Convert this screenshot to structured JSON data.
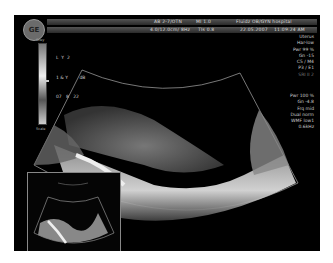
{
  "header": {
    "logo": "GE",
    "row1": [
      "AB 2-7/OTN",
      "MI 1.0",
      "TIs 0.0",
      "Fluidz OB/GYN hospital"
    ],
    "row2": [
      "4.0/12.0cm/ 8Hz",
      "TIs 0.8",
      "22.05.2007",
      "11:09:24 AM"
    ]
  },
  "grayscale": {
    "top_label": "Grey",
    "bottom_label": "Scale"
  },
  "params_left": [
    "L  Y  2",
    "1 & Y        dB",
    "07   8   22"
  ],
  "params_right_top": [
    "Uterus",
    "Har-low",
    "Pwr 99 %",
    "Gn -15",
    "C5 / M4",
    "P3 / E1",
    "SRI II 2"
  ],
  "params_right_bottom": [
    "Pwr 100 %",
    "Gn -4.8",
    "Frq mid",
    "Dual norm",
    "WMF low1",
    "0.6kHz"
  ],
  "colors": {
    "background": "#000000",
    "frame": "#ffffff",
    "text": "#cccccc"
  }
}
